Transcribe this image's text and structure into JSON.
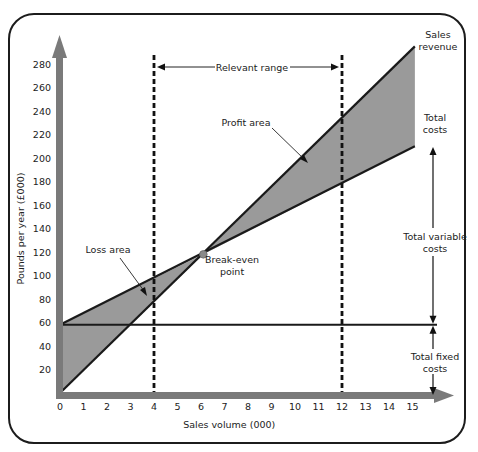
{
  "chart_data": {
    "type": "line",
    "xlabel": "Sales volume (000)",
    "ylabel": "Pounds per year (£000)",
    "xlim": [
      0,
      15
    ],
    "ylim": [
      0,
      280
    ],
    "x_ticks": [
      0,
      1,
      2,
      3,
      4,
      5,
      6,
      7,
      8,
      9,
      10,
      11,
      12,
      13,
      14,
      15
    ],
    "y_ticks": [
      20,
      40,
      60,
      80,
      100,
      120,
      140,
      160,
      180,
      200,
      220,
      240,
      260,
      280
    ],
    "grid": false,
    "series": [
      {
        "name": "Sales revenue",
        "x": [
          0,
          15.1
        ],
        "values": [
          0,
          295
        ]
      },
      {
        "name": "Total costs",
        "x": [
          0,
          15.1
        ],
        "values": [
          58,
          210
        ]
      },
      {
        "name": "Total fixed costs",
        "x": [
          0,
          16
        ],
        "values": [
          58,
          58
        ]
      }
    ],
    "break_even_point": {
      "x": 6.1,
      "y": 118,
      "label": "Break-even point"
    },
    "relevant_range": {
      "from": 4,
      "to": 12,
      "label": "Relevant range"
    },
    "annotations": {
      "loss_area": "Loss area",
      "profit_area": "Profit area",
      "sales_revenue": [
        "Sales",
        "revenue"
      ],
      "total_costs": [
        "Total",
        "costs"
      ],
      "total_variable_costs": [
        "Total variable",
        "costs"
      ],
      "total_fixed_costs": [
        "Total fixed",
        "costs"
      ],
      "break_even": [
        "Break-even",
        "point"
      ]
    },
    "colors": {
      "axis": "#7a7a7a",
      "shade": "#9a9a9a",
      "line": "#1a1a1a",
      "bep": "#8a8a8a"
    }
  }
}
